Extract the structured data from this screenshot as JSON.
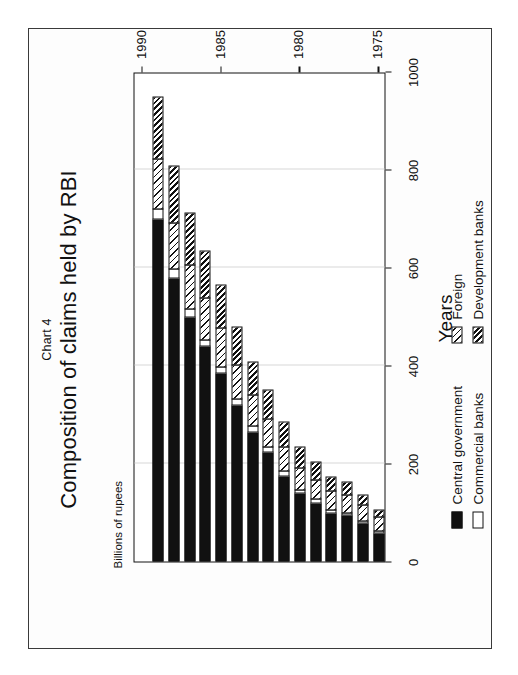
{
  "figure": {
    "chart_number": "Chart 4",
    "title": "Composition of claims held by RBI",
    "orientation": "rotated-90-ccw"
  },
  "legend": {
    "entries": [
      {
        "label": "Central government",
        "swatch": "solid-black",
        "color": "#111111"
      },
      {
        "label": "Commercial banks",
        "swatch": "solid-white",
        "color": "#ffffff"
      },
      {
        "label": "Foreign",
        "swatch": "light-diagonal-hatch",
        "color": "#111111"
      },
      {
        "label": "Development banks",
        "swatch": "dense-diagonal-hatch",
        "color": "#111111"
      }
    ]
  },
  "chart_data": {
    "type": "bar",
    "orientation": "horizontal-stacked",
    "title": "Composition of claims held by RBI",
    "subtitle": "Chart 4",
    "xlabel": "Years",
    "ylabel": "Billions of rupees",
    "grid": true,
    "legend_position": "bottom",
    "value_axis": {
      "label": "Billions of rupees",
      "ticks": [
        0,
        200,
        400,
        600,
        800,
        1000
      ],
      "tick_labels": [
        "0",
        "200",
        "400",
        "600",
        "800",
        "1000"
      ],
      "lim": [
        0,
        1000
      ]
    },
    "category_axis": {
      "label": "Years",
      "ticks": [
        1975,
        1980,
        1985,
        1990
      ],
      "tick_labels": [
        "1975",
        "1980",
        "1985",
        "1990"
      ],
      "lim": [
        1974.5,
        1990.5
      ]
    },
    "categories": [
      1975,
      1976,
      1977,
      1978,
      1979,
      1980,
      1981,
      1982,
      1983,
      1984,
      1985,
      1986,
      1987,
      1988,
      1989
    ],
    "series": [
      {
        "name": "Central government",
        "values": [
          60,
          80,
          95,
          100,
          120,
          140,
          175,
          225,
          265,
          320,
          385,
          440,
          500,
          580,
          700
        ]
      },
      {
        "name": "Commercial banks",
        "values": [
          6,
          6,
          8,
          8,
          10,
          10,
          12,
          12,
          14,
          14,
          16,
          16,
          18,
          20,
          22
        ]
      },
      {
        "name": "Foreign",
        "values": [
          30,
          34,
          38,
          40,
          42,
          46,
          52,
          58,
          66,
          72,
          80,
          86,
          92,
          96,
          105
        ]
      },
      {
        "name": "Development banks",
        "values": [
          16,
          22,
          28,
          32,
          38,
          44,
          52,
          62,
          70,
          80,
          90,
          98,
          108,
          118,
          128
        ]
      }
    ],
    "totals": [
      112,
      142,
      169,
      180,
      210,
      240,
      291,
      357,
      415,
      486,
      571,
      640,
      718,
      814,
      955
    ]
  }
}
